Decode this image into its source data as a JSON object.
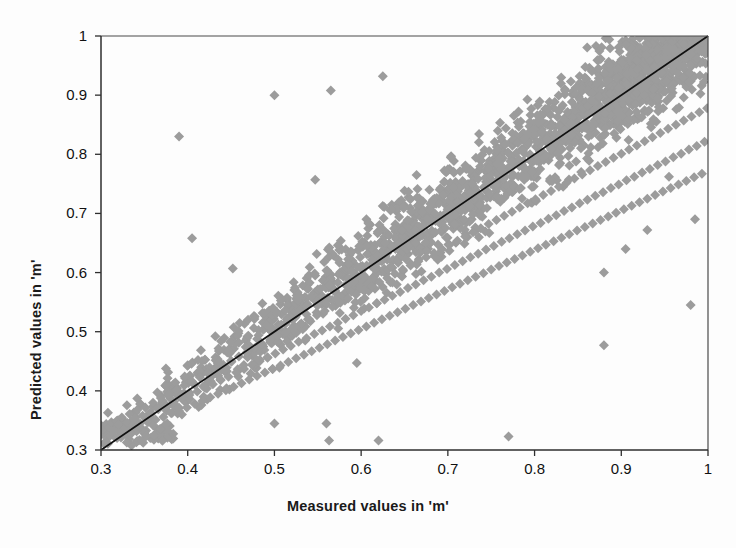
{
  "chart_data": {
    "type": "scatter",
    "title": "",
    "xlabel": "Measured values in 'm'",
    "ylabel": "Predicted values in 'm'",
    "xlim": [
      0.3,
      1.0
    ],
    "ylim": [
      0.3,
      1.0
    ],
    "xticks": [
      "0.3",
      "0.4",
      "0.5",
      "0.6",
      "0.7",
      "0.8",
      "0.9",
      "1"
    ],
    "yticks": [
      "0.3",
      "0.4",
      "0.5",
      "0.6",
      "0.7",
      "0.8",
      "0.9",
      "1"
    ],
    "grid": false,
    "legend": "none",
    "marker": {
      "shape": "diamond",
      "color": "#9c9c9c",
      "size_px": 10
    },
    "reference_line": {
      "name": "one-to-one-line",
      "type": "identity",
      "from": [
        0.3,
        0.3
      ],
      "to": [
        1.0,
        1.0
      ],
      "color": "#111111",
      "width_px": 1.6
    },
    "series": [
      {
        "name": "Measured vs Predicted",
        "points": [
          [
            0.3,
            0.341
          ],
          [
            0.303,
            0.336
          ],
          [
            0.306,
            0.344
          ],
          [
            0.309,
            0.338
          ],
          [
            0.312,
            0.347
          ],
          [
            0.315,
            0.332
          ],
          [
            0.318,
            0.349
          ],
          [
            0.321,
            0.34
          ],
          [
            0.324,
            0.355
          ],
          [
            0.327,
            0.337
          ],
          [
            0.33,
            0.346
          ],
          [
            0.333,
            0.361
          ],
          [
            0.336,
            0.342
          ],
          [
            0.339,
            0.353
          ],
          [
            0.342,
            0.368
          ],
          [
            0.345,
            0.345
          ],
          [
            0.348,
            0.358
          ],
          [
            0.351,
            0.372
          ],
          [
            0.354,
            0.347
          ],
          [
            0.357,
            0.364
          ],
          [
            0.36,
            0.38
          ],
          [
            0.363,
            0.351
          ],
          [
            0.366,
            0.369
          ],
          [
            0.369,
            0.388
          ],
          [
            0.372,
            0.356
          ],
          [
            0.375,
            0.374
          ],
          [
            0.378,
            0.394
          ],
          [
            0.381,
            0.362
          ],
          [
            0.384,
            0.381
          ],
          [
            0.387,
            0.401
          ],
          [
            0.39,
            0.366
          ],
          [
            0.393,
            0.387
          ],
          [
            0.396,
            0.409
          ],
          [
            0.399,
            0.372
          ],
          [
            0.402,
            0.393
          ],
          [
            0.405,
            0.416
          ],
          [
            0.408,
            0.378
          ],
          [
            0.411,
            0.399
          ],
          [
            0.414,
            0.423
          ],
          [
            0.417,
            0.383
          ],
          [
            0.42,
            0.405
          ],
          [
            0.423,
            0.43
          ],
          [
            0.426,
            0.389
          ],
          [
            0.429,
            0.411
          ],
          [
            0.432,
            0.437
          ],
          [
            0.435,
            0.395
          ],
          [
            0.438,
            0.418
          ],
          [
            0.441,
            0.444
          ],
          [
            0.444,
            0.401
          ],
          [
            0.447,
            0.424
          ],
          [
            0.45,
            0.451
          ],
          [
            0.453,
            0.407
          ],
          [
            0.456,
            0.431
          ],
          [
            0.459,
            0.458
          ],
          [
            0.462,
            0.413
          ],
          [
            0.465,
            0.437
          ],
          [
            0.468,
            0.465
          ],
          [
            0.471,
            0.419
          ],
          [
            0.474,
            0.444
          ],
          [
            0.477,
            0.472
          ],
          [
            0.48,
            0.425
          ],
          [
            0.483,
            0.45
          ],
          [
            0.486,
            0.479
          ],
          [
            0.489,
            0.431
          ],
          [
            0.492,
            0.457
          ],
          [
            0.495,
            0.486
          ],
          [
            0.498,
            0.437
          ],
          [
            0.501,
            0.463
          ],
          [
            0.504,
            0.493
          ],
          [
            0.507,
            0.443
          ],
          [
            0.51,
            0.47
          ],
          [
            0.513,
            0.5
          ],
          [
            0.516,
            0.449
          ],
          [
            0.519,
            0.476
          ],
          [
            0.522,
            0.507
          ],
          [
            0.525,
            0.455
          ],
          [
            0.528,
            0.483
          ],
          [
            0.531,
            0.514
          ],
          [
            0.534,
            0.461
          ],
          [
            0.537,
            0.489
          ],
          [
            0.54,
            0.521
          ],
          [
            0.543,
            0.467
          ],
          [
            0.546,
            0.496
          ],
          [
            0.549,
            0.528
          ],
          [
            0.552,
            0.473
          ],
          [
            0.555,
            0.502
          ],
          [
            0.558,
            0.535
          ],
          [
            0.561,
            0.479
          ],
          [
            0.564,
            0.509
          ],
          [
            0.567,
            0.542
          ],
          [
            0.57,
            0.485
          ],
          [
            0.573,
            0.515
          ],
          [
            0.576,
            0.549
          ],
          [
            0.579,
            0.491
          ],
          [
            0.582,
            0.522
          ],
          [
            0.585,
            0.556
          ],
          [
            0.588,
            0.497
          ],
          [
            0.591,
            0.528
          ],
          [
            0.594,
            0.563
          ],
          [
            0.597,
            0.503
          ],
          [
            0.6,
            0.535
          ],
          [
            0.603,
            0.57
          ],
          [
            0.606,
            0.509
          ],
          [
            0.609,
            0.541
          ],
          [
            0.612,
            0.577
          ],
          [
            0.615,
            0.515
          ],
          [
            0.618,
            0.548
          ],
          [
            0.621,
            0.584
          ],
          [
            0.624,
            0.521
          ],
          [
            0.627,
            0.554
          ],
          [
            0.63,
            0.591
          ],
          [
            0.633,
            0.527
          ],
          [
            0.636,
            0.561
          ],
          [
            0.639,
            0.598
          ],
          [
            0.642,
            0.533
          ],
          [
            0.645,
            0.567
          ],
          [
            0.648,
            0.605
          ],
          [
            0.651,
            0.539
          ],
          [
            0.654,
            0.574
          ],
          [
            0.657,
            0.612
          ],
          [
            0.66,
            0.545
          ],
          [
            0.663,
            0.58
          ],
          [
            0.666,
            0.619
          ],
          [
            0.669,
            0.551
          ],
          [
            0.672,
            0.587
          ],
          [
            0.675,
            0.626
          ],
          [
            0.678,
            0.557
          ],
          [
            0.681,
            0.593
          ],
          [
            0.684,
            0.633
          ],
          [
            0.687,
            0.563
          ],
          [
            0.69,
            0.6
          ],
          [
            0.693,
            0.64
          ],
          [
            0.696,
            0.569
          ],
          [
            0.699,
            0.606
          ],
          [
            0.702,
            0.647
          ],
          [
            0.705,
            0.575
          ],
          [
            0.708,
            0.613
          ],
          [
            0.711,
            0.654
          ],
          [
            0.714,
            0.581
          ],
          [
            0.717,
            0.619
          ],
          [
            0.72,
            0.661
          ],
          [
            0.723,
            0.587
          ],
          [
            0.726,
            0.626
          ],
          [
            0.729,
            0.668
          ],
          [
            0.732,
            0.593
          ],
          [
            0.735,
            0.632
          ],
          [
            0.738,
            0.675
          ],
          [
            0.741,
            0.599
          ],
          [
            0.744,
            0.639
          ],
          [
            0.747,
            0.682
          ],
          [
            0.75,
            0.605
          ],
          [
            0.753,
            0.645
          ],
          [
            0.756,
            0.689
          ],
          [
            0.759,
            0.611
          ],
          [
            0.762,
            0.652
          ],
          [
            0.765,
            0.696
          ],
          [
            0.768,
            0.617
          ],
          [
            0.771,
            0.658
          ],
          [
            0.774,
            0.703
          ],
          [
            0.777,
            0.623
          ],
          [
            0.78,
            0.665
          ],
          [
            0.783,
            0.71
          ],
          [
            0.786,
            0.629
          ],
          [
            0.789,
            0.671
          ],
          [
            0.792,
            0.717
          ],
          [
            0.795,
            0.635
          ],
          [
            0.798,
            0.678
          ],
          [
            0.801,
            0.724
          ],
          [
            0.804,
            0.641
          ],
          [
            0.807,
            0.684
          ],
          [
            0.81,
            0.731
          ],
          [
            0.813,
            0.647
          ],
          [
            0.816,
            0.691
          ],
          [
            0.819,
            0.738
          ],
          [
            0.822,
            0.653
          ],
          [
            0.825,
            0.697
          ],
          [
            0.828,
            0.745
          ],
          [
            0.831,
            0.659
          ],
          [
            0.834,
            0.704
          ],
          [
            0.837,
            0.752
          ],
          [
            0.84,
            0.665
          ],
          [
            0.843,
            0.71
          ],
          [
            0.846,
            0.759
          ],
          [
            0.849,
            0.671
          ],
          [
            0.852,
            0.717
          ],
          [
            0.855,
            0.766
          ],
          [
            0.858,
            0.677
          ],
          [
            0.861,
            0.723
          ],
          [
            0.864,
            0.773
          ],
          [
            0.867,
            0.683
          ],
          [
            0.87,
            0.73
          ],
          [
            0.873,
            0.78
          ],
          [
            0.876,
            0.689
          ],
          [
            0.879,
            0.736
          ],
          [
            0.882,
            0.787
          ],
          [
            0.885,
            0.695
          ],
          [
            0.888,
            0.743
          ],
          [
            0.891,
            0.794
          ],
          [
            0.894,
            0.701
          ],
          [
            0.897,
            0.749
          ],
          [
            0.9,
            0.801
          ],
          [
            0.903,
            0.707
          ],
          [
            0.906,
            0.756
          ],
          [
            0.909,
            0.808
          ],
          [
            0.912,
            0.713
          ],
          [
            0.915,
            0.762
          ],
          [
            0.918,
            0.815
          ],
          [
            0.921,
            0.719
          ],
          [
            0.924,
            0.769
          ],
          [
            0.927,
            0.822
          ],
          [
            0.93,
            0.725
          ],
          [
            0.933,
            0.775
          ],
          [
            0.936,
            0.829
          ],
          [
            0.939,
            0.731
          ],
          [
            0.942,
            0.782
          ],
          [
            0.945,
            0.836
          ],
          [
            0.948,
            0.737
          ],
          [
            0.951,
            0.788
          ],
          [
            0.954,
            0.843
          ],
          [
            0.957,
            0.743
          ],
          [
            0.96,
            0.795
          ],
          [
            0.963,
            0.85
          ],
          [
            0.966,
            0.749
          ],
          [
            0.969,
            0.801
          ],
          [
            0.972,
            0.857
          ],
          [
            0.975,
            0.755
          ],
          [
            0.978,
            0.808
          ],
          [
            0.981,
            0.864
          ],
          [
            0.984,
            0.761
          ],
          [
            0.987,
            0.814
          ],
          [
            0.99,
            0.871
          ],
          [
            0.993,
            0.767
          ],
          [
            0.996,
            0.821
          ],
          [
            0.999,
            0.878
          ],
          [
            0.39,
            0.83
          ],
          [
            0.5,
            0.9
          ],
          [
            0.565,
            0.908
          ],
          [
            0.625,
            0.932
          ],
          [
            0.405,
            0.658
          ],
          [
            0.452,
            0.607
          ],
          [
            0.5,
            0.345
          ],
          [
            0.547,
            0.757
          ],
          [
            0.56,
            0.345
          ],
          [
            0.563,
            0.316
          ],
          [
            0.595,
            0.447
          ],
          [
            0.62,
            0.316
          ],
          [
            0.77,
            0.323
          ],
          [
            0.88,
            0.477
          ],
          [
            0.88,
            0.6
          ],
          [
            0.905,
            0.64
          ],
          [
            0.93,
            0.672
          ],
          [
            0.955,
            0.762
          ],
          [
            0.98,
            0.545
          ],
          [
            0.985,
            0.69
          ],
          [
            0.42,
            0.268
          ],
          [
            0.36,
            0.342
          ],
          [
            0.34,
            0.338
          ],
          [
            0.32,
            0.343
          ]
        ]
      }
    ]
  },
  "axes": {
    "x_title": "Measured values in 'm'",
    "y_title": "Predicted values in 'm'",
    "x_tick_labels": [
      "0.3",
      "0.4",
      "0.5",
      "0.6",
      "0.7",
      "0.8",
      "0.9",
      "1"
    ],
    "y_tick_labels": [
      "1",
      "0.9",
      "0.8",
      "0.7",
      "0.6",
      "0.5",
      "0.4",
      "0.3"
    ]
  },
  "colors": {
    "marker": "#9c9c9c",
    "line": "#111111",
    "axis": "#3a3a3a",
    "background": "#fdfdfd",
    "text": "#111111"
  }
}
